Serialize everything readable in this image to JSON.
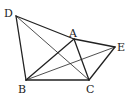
{
  "diagram": {
    "type": "geometry",
    "points": {
      "A": {
        "label": "A",
        "x": 74,
        "y": 39,
        "lx": 69,
        "ly": 37
      },
      "B": {
        "label": "B",
        "x": 26,
        "y": 80,
        "lx": 18,
        "ly": 93
      },
      "C": {
        "label": "C",
        "x": 89,
        "y": 80,
        "lx": 86,
        "ly": 93
      },
      "D": {
        "label": "D",
        "x": 16,
        "y": 16,
        "lx": 4,
        "ly": 17
      },
      "E": {
        "label": "E",
        "x": 115,
        "y": 47,
        "lx": 117,
        "ly": 51
      }
    },
    "segments": [
      {
        "from": "D",
        "to": "A",
        "weight": "thick"
      },
      {
        "from": "A",
        "to": "E",
        "weight": "thick"
      },
      {
        "from": "D",
        "to": "B",
        "weight": "thick"
      },
      {
        "from": "B",
        "to": "C",
        "weight": "thick"
      },
      {
        "from": "C",
        "to": "E",
        "weight": "thick"
      },
      {
        "from": "B",
        "to": "A",
        "weight": "thick"
      },
      {
        "from": "A",
        "to": "C",
        "weight": "thick"
      },
      {
        "from": "D",
        "to": "C",
        "weight": "thin"
      },
      {
        "from": "B",
        "to": "E",
        "weight": "thin"
      }
    ]
  }
}
